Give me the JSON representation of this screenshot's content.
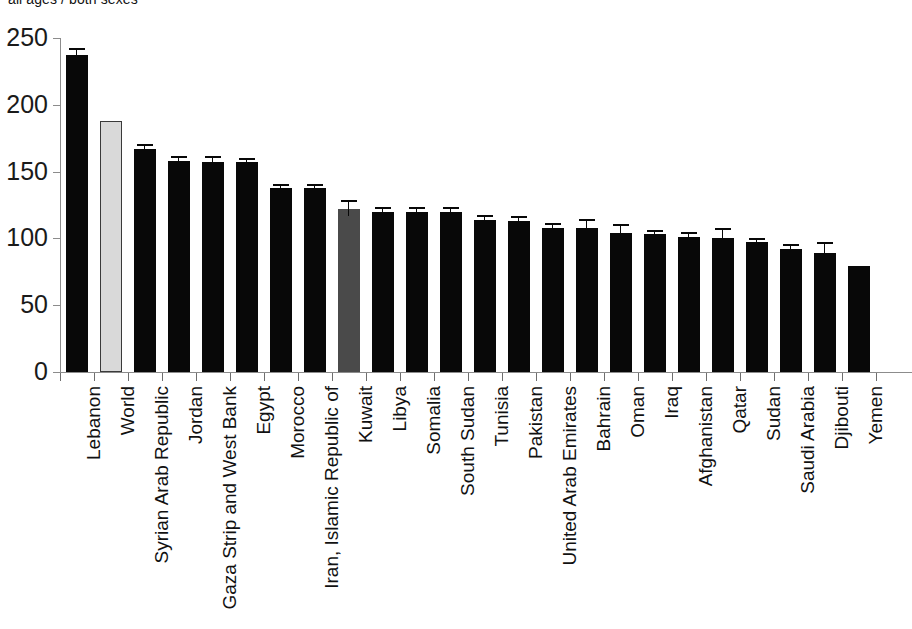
{
  "title": "all ages / both sexes",
  "chart_data": {
    "type": "bar",
    "title": "all ages / both sexes",
    "xlabel": "",
    "ylabel": "",
    "ylim": [
      0,
      250
    ],
    "yticks": [
      0,
      50,
      100,
      150,
      200,
      250
    ],
    "grid": false,
    "legend": "none",
    "orientation": "vertical",
    "categories": [
      "Lebanon",
      "World",
      "Syrian Arab Republic",
      "Jordan",
      "Gaza Strip and West Bank",
      "Egypt",
      "Morocco",
      "Iran, Islamic Republic of",
      "Kuwait",
      "Libya",
      "Somalia",
      "South Sudan",
      "Tunisia",
      "Pakistan",
      "United Arab Emirates",
      "Bahrain",
      "Oman",
      "Iraq",
      "Afghanistan",
      "Qatar",
      "Sudan",
      "Saudi Arabia",
      "Djibouti",
      "Yemen"
    ],
    "values": [
      237,
      188,
      167,
      158,
      157,
      157,
      138,
      138,
      122,
      120,
      120,
      120,
      114,
      113,
      108,
      108,
      104,
      103,
      101,
      100,
      97,
      92,
      89,
      79
    ],
    "error_upper": [
      4,
      0,
      2,
      2,
      3,
      2,
      1,
      1,
      5,
      2,
      2,
      2,
      2,
      2,
      2,
      5,
      5,
      2,
      2,
      6,
      2,
      2,
      7,
      0
    ],
    "error_lower": [
      4,
      0,
      2,
      2,
      3,
      2,
      1,
      1,
      5,
      2,
      2,
      2,
      2,
      2,
      2,
      5,
      5,
      2,
      2,
      6,
      2,
      2,
      7,
      0
    ],
    "bar_colors": [
      "black",
      "lightgray",
      "black",
      "black",
      "black",
      "black",
      "black",
      "black",
      "darkgray",
      "black",
      "black",
      "black",
      "black",
      "black",
      "black",
      "black",
      "black",
      "black",
      "black",
      "black",
      "black",
      "black",
      "black",
      "black"
    ]
  },
  "colors": {
    "bar_black": "#080808",
    "bar_lightgray": "#d9d9d9",
    "bar_darkgray": "#4a4a4a",
    "axis": "#8c8c8c",
    "text": "#111111",
    "background": "#ffffff"
  }
}
